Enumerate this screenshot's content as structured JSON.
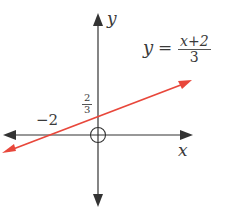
{
  "axes": {
    "x_label": "x",
    "y_label": "y",
    "axis_color": "#333333"
  },
  "line": {
    "color": "#e8473b",
    "equation": {
      "lhs": "y",
      "eq": "=",
      "numerator": "x+2",
      "denominator": "3"
    }
  },
  "intercepts": {
    "x_intercept": "−2",
    "y_intercept_num": "2",
    "y_intercept_den": "3"
  }
}
